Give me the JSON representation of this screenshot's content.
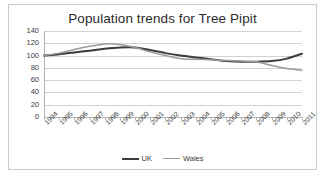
{
  "chart_data": {
    "type": "line",
    "title": "Population trends for Tree Pipit",
    "xlabel": "",
    "ylabel": "",
    "ylim": [
      0,
      140
    ],
    "y_ticks": [
      0,
      20,
      40,
      60,
      80,
      100,
      120,
      140
    ],
    "grid": true,
    "legend_position": "bottom",
    "categories": [
      "1994",
      "1995",
      "1996",
      "1997",
      "1998",
      "1999",
      "2000",
      "2001",
      "2002",
      "2003",
      "2004",
      "2005",
      "2006",
      "2007",
      "2008",
      "2009",
      "2010",
      "2011"
    ],
    "series": [
      {
        "name": "UK",
        "color": "#3b3b3b",
        "values": [
          100,
          102,
          105,
          108,
          111,
          113,
          113,
          109,
          104,
          100,
          97,
          94,
          91,
          90,
          90,
          91,
          95,
          103
        ]
      },
      {
        "name": "Wales",
        "color": "#9a9a9a",
        "values": [
          100,
          104,
          110,
          115,
          119,
          118,
          113,
          106,
          100,
          95,
          94,
          93,
          92,
          91,
          90,
          84,
          79,
          76
        ]
      }
    ]
  },
  "y_tick_labels": [
    "140",
    "120",
    "100",
    "80",
    "60",
    "40",
    "20",
    "0"
  ],
  "legend": [
    {
      "label": "UK",
      "color": "#3b3b3b",
      "thickness": "2.2px"
    },
    {
      "label": "Wales",
      "color": "#9a9a9a",
      "thickness": "1.8px"
    }
  ]
}
